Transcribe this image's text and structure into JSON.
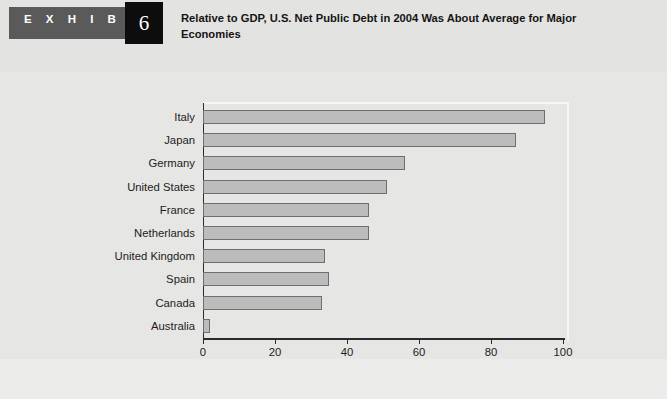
{
  "header": {
    "exhibit_word": "E X H I B I T",
    "exhibit_number": "6",
    "title": "Relative to GDP, U.S. Net Public Debt in 2004 Was About Average for Major Economies"
  },
  "chart_data": {
    "type": "bar",
    "orientation": "horizontal",
    "title": "Relative to GDP, U.S. Net Public Debt in 2004 Was About Average for Major Economies",
    "xlabel": "Net public debt as percentage of GDP",
    "ylabel": "",
    "xlim": [
      0,
      100
    ],
    "xticks": [
      0,
      20,
      40,
      60,
      80,
      100
    ],
    "xtick_labels": [
      "0",
      "20",
      "40",
      "60",
      "80",
      "100"
    ],
    "grid": false,
    "legend": null,
    "bar_color": "#bcbcbc",
    "bar_edge_color": "#6e6e6e",
    "categories": [
      "Italy",
      "Japan",
      "Germany",
      "United States",
      "France",
      "Netherlands",
      "United Kingdom",
      "Spain",
      "Canada",
      "Australia"
    ],
    "values": [
      95,
      87,
      56,
      51,
      46,
      46,
      34,
      35,
      33,
      2
    ]
  },
  "colors": {
    "page_background": "#e9e9e7",
    "header_background": "#e3e3e1",
    "exhibit_tag": "#5a5a5a",
    "exhibit_number_box": "#0d0d0d",
    "axis": "#2c2c2c",
    "footer_rule": "#8e8e8e"
  }
}
